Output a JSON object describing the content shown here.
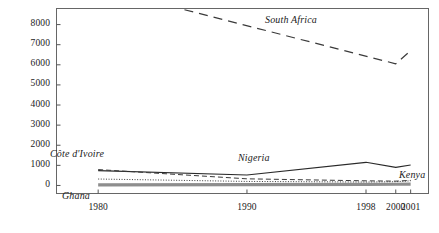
{
  "chart_data": {
    "type": "line",
    "title": "",
    "subtitle": "",
    "xlabel": "",
    "ylabel": "",
    "x": [
      1980,
      1990,
      1998,
      2000,
      2001
    ],
    "xtick_labels": [
      "1980",
      "1990",
      "1998",
      "2000",
      "2001"
    ],
    "ytick_labels": [
      "0",
      "1000",
      "2000",
      "3000",
      "4000",
      "5000",
      "6000",
      "7000",
      "8000"
    ],
    "yticks": [
      0,
      1000,
      2000,
      3000,
      4000,
      5000,
      6000,
      7000,
      8000
    ],
    "ylim": [
      -400,
      8800
    ],
    "xlim": [
      1977.2,
      2002.2
    ],
    "grid": false,
    "legend_position": "inline-annotations",
    "series": [
      {
        "name": "South Africa",
        "style": "long-dashed",
        "color": "#3a3a3a",
        "x": [
          1985.8,
          2000,
          2001
        ],
        "values": [
          8740,
          6050,
          6700
        ],
        "label_x": 265,
        "label_y": 14
      },
      {
        "name": "Nigeria",
        "style": "solid",
        "color": "#2a2a2a",
        "x": [
          1980,
          1990,
          1998,
          2000,
          2001
        ],
        "values": [
          740,
          520,
          1150,
          900,
          1020
        ],
        "label_x": 238,
        "label_y": 152
      },
      {
        "name": "Côte d'Ivoire",
        "style": "dashed",
        "color": "#3a3a3a",
        "x": [
          1980,
          1990,
          1998,
          2000,
          2001
        ],
        "values": [
          790,
          330,
          230,
          215,
          250
        ],
        "label_x": 50,
        "label_y": 148
      },
      {
        "name": "Kenya",
        "style": "dotted",
        "color": "#3a3a3a",
        "x": [
          1980,
          1990,
          1998,
          2000,
          2001
        ],
        "values": [
          320,
          200,
          170,
          185,
          230
        ],
        "label_x": 399,
        "label_y": 169
      },
      {
        "name": "Ghana",
        "style": "thick-gray",
        "color": "#8e8e8e",
        "x": [
          1980,
          1990,
          1998,
          2000,
          2001
        ],
        "values": [
          30,
          40,
          55,
          60,
          70
        ],
        "label_x": 62,
        "label_y": 190
      }
    ]
  },
  "axes": {
    "frame_color": "#555555",
    "tick_color": "#555555"
  }
}
